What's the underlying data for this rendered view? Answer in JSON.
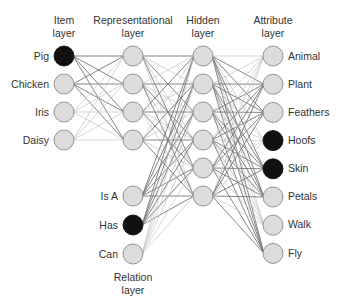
{
  "layers": {
    "item": {
      "title_line1": "Item",
      "title_line2": "layer",
      "nodes": [
        {
          "label": "Pig",
          "active": true
        },
        {
          "label": "Chicken",
          "active": false
        },
        {
          "label": "Iris",
          "active": false
        },
        {
          "label": "Daisy",
          "active": false
        }
      ]
    },
    "representational": {
      "title_line1": "Representational",
      "title_line2": "layer",
      "count": 4
    },
    "hidden": {
      "title_line1": "Hidden",
      "title_line2": "layer",
      "count": 6
    },
    "relation": {
      "title_line1": "Relation",
      "title_line2": "layer",
      "nodes": [
        {
          "label": "Is A",
          "active": false
        },
        {
          "label": "Has",
          "active": true
        },
        {
          "label": "Can",
          "active": false
        }
      ]
    },
    "attribute": {
      "title_line1": "Attribute",
      "title_line2": "layer",
      "nodes": [
        {
          "label": "Animal",
          "active": false
        },
        {
          "label": "Plant",
          "active": false
        },
        {
          "label": "Feathers",
          "active": false
        },
        {
          "label": "Hoofs",
          "active": true
        },
        {
          "label": "Skin",
          "active": true
        },
        {
          "label": "Petals",
          "active": false
        },
        {
          "label": "Walk",
          "active": false
        },
        {
          "label": "Fly",
          "active": false
        }
      ]
    }
  },
  "colors": {
    "node_fill": "#dcdcdc",
    "node_active": "#111111",
    "node_stroke": "#8a8a8a",
    "edge": "#777777",
    "edge_light": "#c4c4c4"
  }
}
